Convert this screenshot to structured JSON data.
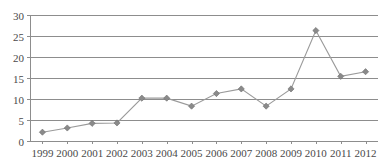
{
  "chart_data": {
    "type": "line",
    "title": "",
    "subtitle": "",
    "xlabel": "",
    "ylabel": "",
    "categories": [
      "1999",
      "2000",
      "2001",
      "2002",
      "2003",
      "2004",
      "2005",
      "2006",
      "2007",
      "2008",
      "2009",
      "2010",
      "2011",
      "2012"
    ],
    "values": [
      2.1,
      3.1,
      4.2,
      4.3,
      10.2,
      10.2,
      8.3,
      11.3,
      12.4,
      8.3,
      12.4,
      26.3,
      15.4,
      16.5
    ],
    "series": [
      {
        "name": "",
        "values": [
          2.1,
          3.1,
          4.2,
          4.3,
          10.2,
          10.2,
          8.3,
          11.3,
          12.4,
          8.3,
          12.4,
          26.3,
          15.4,
          16.5
        ]
      }
    ],
    "ylim": [
      0,
      30
    ],
    "yticks": [
      0,
      5,
      10,
      15,
      20,
      25,
      30
    ],
    "ytick_labels": [
      "0",
      "5",
      "10",
      "15",
      "20",
      "25",
      "30"
    ],
    "xtick_labels": [
      "1999",
      "2000",
      "2001",
      "2002",
      "2003",
      "2004",
      "2005",
      "2006",
      "2007",
      "2008",
      "2009",
      "2010",
      "2011",
      "2012"
    ],
    "grid": true,
    "grid_axis": "y",
    "legend": false,
    "legend_position": "none",
    "marker": "diamond",
    "colors": {
      "line": "#9a9a9a",
      "marker": "#8a8a8a",
      "grid": "#8d8d8d",
      "axis": "#8d8d8d",
      "text": "#4a4a4a",
      "background": "#ffffff"
    },
    "annotations": []
  },
  "layout": {
    "plot_left": 30,
    "plot_right": 378,
    "plot_top": 15,
    "plot_bottom": 141,
    "xlabel_y": 157
  }
}
